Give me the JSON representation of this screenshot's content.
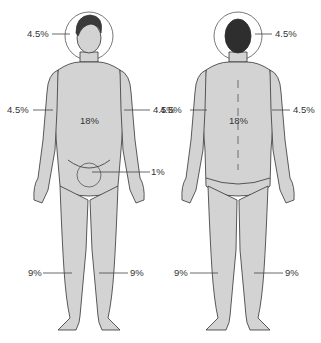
{
  "diagram": {
    "views": [
      {
        "name": "anterior",
        "labels": {
          "head": "4.5%",
          "left_arm": "4.5%",
          "right_arm": "4.5%",
          "trunk": "18%",
          "genitals": "1%",
          "left_leg": "9%",
          "right_leg": "9%"
        }
      },
      {
        "name": "posterior",
        "labels": {
          "head": "4.5%",
          "left_arm": "4.5%",
          "right_arm": "4.5%",
          "trunk": "18%",
          "left_leg": "9%",
          "right_leg": "9%"
        }
      }
    ]
  },
  "colors": {
    "skin": "#d3d3d3",
    "outline": "#333333",
    "hair_front": "#3a3a3a",
    "hair_back": "#2e2e2e",
    "leader": "#444444"
  }
}
